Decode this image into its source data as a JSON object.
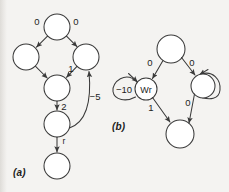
{
  "figure": {
    "background_color": "#f4f3f1",
    "stroke_color": "#3a3a3a",
    "text_color": "#1d1d1d"
  },
  "panels": [
    {
      "id": "a",
      "caption": "(a)",
      "nodes": [
        {
          "id": "a-top",
          "label": "",
          "cx": 57,
          "cy": 27,
          "r": 13
        },
        {
          "id": "a-left",
          "label": "",
          "cx": 26,
          "cy": 57,
          "r": 13
        },
        {
          "id": "a-right",
          "label": "",
          "cx": 86,
          "cy": 57,
          "r": 13
        },
        {
          "id": "a-middle",
          "label": "",
          "cx": 57,
          "cy": 88,
          "r": 13
        },
        {
          "id": "a-lower",
          "label": "",
          "cx": 57,
          "cy": 124,
          "r": 13
        },
        {
          "id": "a-bottom",
          "label": "",
          "cx": 57,
          "cy": 166,
          "r": 13
        }
      ],
      "edges": [
        {
          "id": "a-e1",
          "from": "a-top",
          "to": "a-left",
          "label": "0",
          "label_x": 37,
          "label_y": 22
        },
        {
          "id": "a-e2",
          "from": "a-top",
          "to": "a-right",
          "label": "0",
          "label_x": 74,
          "label_y": 22
        },
        {
          "id": "a-e3",
          "from": "a-left",
          "to": "a-middle",
          "label": "",
          "label_x": 0,
          "label_y": 0
        },
        {
          "id": "a-e4",
          "from": "a-right",
          "to": "a-middle",
          "label": "1",
          "label_x": 70,
          "label_y": 70
        },
        {
          "id": "a-e5",
          "from": "a-middle",
          "to": "a-lower",
          "label": "2",
          "label_x": 62,
          "label_y": 108
        },
        {
          "id": "a-e6",
          "from": "a-lower",
          "to": "a-right",
          "label": "−5",
          "label_x": 93,
          "label_y": 96
        },
        {
          "id": "a-e7",
          "from": "a-lower",
          "to": "a-bottom",
          "label": "r",
          "label_x": 62,
          "label_y": 142
        }
      ]
    },
    {
      "id": "b",
      "caption": "(b)",
      "nodes": [
        {
          "id": "b-top",
          "label": "",
          "cx": 171,
          "cy": 49,
          "r": 14
        },
        {
          "id": "b-wr",
          "label": "Wr",
          "cx": 146,
          "cy": 89,
          "r": 11
        },
        {
          "id": "b-right",
          "label": "",
          "cx": 203,
          "cy": 86,
          "r": 12
        },
        {
          "id": "b-bottom",
          "label": "",
          "cx": 180,
          "cy": 134,
          "r": 14
        }
      ],
      "edges": [
        {
          "id": "b-e1",
          "from": "b-top",
          "to": "b-wr",
          "label": "0",
          "label_x": 150,
          "label_y": 62
        },
        {
          "id": "b-e2",
          "from": "b-top",
          "to": "b-right",
          "label": "0",
          "label_x": 190,
          "label_y": 62
        },
        {
          "id": "b-e3",
          "from": "b-wr",
          "to": "b-bottom",
          "label": "1",
          "label_x": 151,
          "label_y": 108
        },
        {
          "id": "b-e4",
          "from": "b-right",
          "to": "b-bottom",
          "label": "0",
          "label_x": 188,
          "label_y": 103
        },
        {
          "id": "b-e5",
          "from": "b-wr",
          "to": "b-wr",
          "label": "−10",
          "label_x": 124,
          "label_y": 89,
          "self_loop": true
        },
        {
          "id": "b-e6",
          "from": "b-right",
          "to": "b-right",
          "label": "",
          "label_x": 0,
          "label_y": 0,
          "self_loop": true
        }
      ]
    }
  ]
}
